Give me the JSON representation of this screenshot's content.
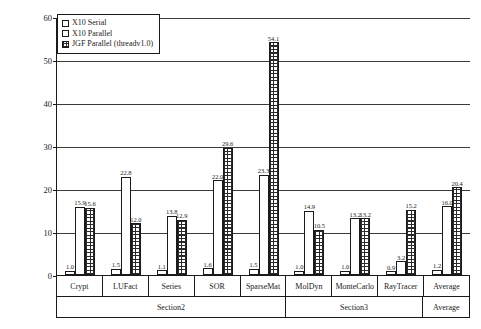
{
  "chart_data": {
    "type": "bar",
    "title": "",
    "xlabel": "",
    "ylabel": "Speedup w.r.t. JGF serial (v2.0)",
    "ylim": [
      0,
      60
    ],
    "yticks": [
      0,
      10,
      20,
      30,
      40,
      50,
      60
    ],
    "ytick_labels": [
      "0",
      "10",
      "20",
      "30",
      "40",
      "50",
      "60"
    ],
    "grid": true,
    "legend_position": "upper left",
    "categories": [
      "Crypt",
      "LUFact",
      "Series",
      "SOR",
      "SparseMat",
      "MolDyn",
      "MonteCarlo",
      "RayTracer",
      "Average"
    ],
    "group_bands": [
      {
        "label": "Section2",
        "span": 5
      },
      {
        "label": "Section3",
        "span": 3
      },
      {
        "label": "Average",
        "span": 1
      }
    ],
    "series": [
      {
        "name": "X10 Serial",
        "fill": "white",
        "values": [
          1.0,
          1.5,
          1.1,
          1.6,
          1.5,
          1.0,
          1.0,
          0.9,
          1.2
        ],
        "labels": [
          "1.0",
          "1.5",
          "1.1",
          "1.6",
          "1.5",
          "1.0",
          "1.0",
          "0.9",
          "1.2"
        ]
      },
      {
        "name": "X10 Parallel",
        "fill": "fine-grid",
        "values": [
          15.9,
          22.8,
          13.8,
          22.0,
          23.3,
          14.9,
          13.2,
          3.2,
          16.0
        ],
        "labels": [
          "15.9",
          "22.8",
          "13.8",
          "22.0",
          "23.3",
          "14.9",
          "13.2",
          "3.2",
          "16.0"
        ]
      },
      {
        "name": "JGF Parallel (threadv1.0)",
        "fill": "coarse-checker",
        "values": [
          15.6,
          12.0,
          12.9,
          29.6,
          54.1,
          10.5,
          13.2,
          15.2,
          20.4
        ],
        "labels": [
          "15.6",
          "12.0",
          "12.9",
          "29.6",
          "54.1",
          "10.5",
          "13.2",
          "15.2",
          "20.4"
        ]
      }
    ]
  },
  "legend": {
    "items": [
      {
        "label": "X10 Serial"
      },
      {
        "label": "X10 Parallel"
      },
      {
        "label": "JGF Parallel (threadv1.0)"
      }
    ]
  },
  "colors": {
    "axis": "#1a1a1a",
    "grid": "#3a3a3a",
    "background": "#ffffff",
    "hatch": "#2a2a2a"
  }
}
